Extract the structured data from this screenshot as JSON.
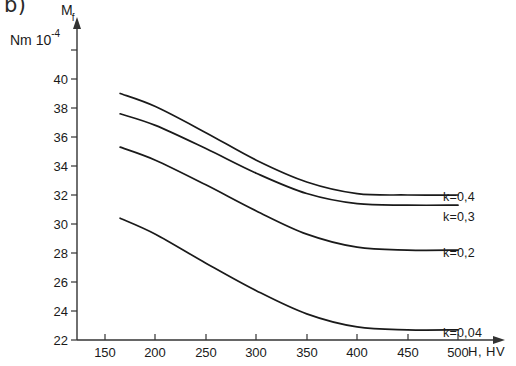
{
  "panel": {
    "label": "b)"
  },
  "axes": {
    "y_title": "M",
    "y_title_sub": "f",
    "y_unit_prefix": "Nm",
    "y_unit_mantissa": "10",
    "y_unit_exponent": "-4",
    "x_title": "H, HV",
    "y_ticks": [
      "22",
      "24",
      "26",
      "28",
      "30",
      "32",
      "34",
      "36",
      "38",
      "40"
    ],
    "x_ticks": [
      "150",
      "200",
      "250",
      "300",
      "350",
      "400",
      "450",
      "500"
    ]
  },
  "chart_data": {
    "type": "line",
    "title": "b)",
    "xlabel": "H, HV",
    "ylabel": "M_f  [Nm 10^-4]",
    "xlim": [
      150,
      500
    ],
    "ylim": [
      22,
      40
    ],
    "grid": false,
    "legend_position": "right-inline",
    "x": [
      165,
      200,
      250,
      300,
      350,
      400,
      450,
      500
    ],
    "series": [
      {
        "name": "k=0,4",
        "label": "k=0,4",
        "values": [
          39.0,
          38.1,
          36.3,
          34.4,
          32.9,
          32.1,
          32.0,
          32.0
        ]
      },
      {
        "name": "k=0,3",
        "label": "k=0,3",
        "values": [
          37.6,
          36.8,
          35.2,
          33.5,
          32.1,
          31.4,
          31.3,
          31.3
        ]
      },
      {
        "name": "k=0,2",
        "label": "k=0,2",
        "values": [
          35.3,
          34.4,
          32.7,
          30.9,
          29.3,
          28.4,
          28.2,
          28.2
        ]
      },
      {
        "name": "k=0,04",
        "label": "k=0,04",
        "values": [
          30.4,
          29.3,
          27.3,
          25.4,
          23.8,
          22.9,
          22.7,
          22.7
        ]
      }
    ]
  },
  "colors": {
    "line": "#1a1a1a",
    "axis": "#3a3a3a",
    "background": "#ffffff"
  }
}
